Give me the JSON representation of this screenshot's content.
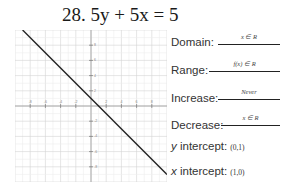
{
  "problem": {
    "number": "28.",
    "equation": "5y + 5x = 5",
    "title": "28. 5y + 5x = 5"
  },
  "graph": {
    "x_ticks": [
      "-8",
      "-6",
      "-4",
      "-2",
      "2",
      "4",
      "6",
      "8"
    ],
    "y_ticks": [
      "8",
      "6",
      "4",
      "2",
      "-2",
      "-4",
      "-6",
      "-8"
    ],
    "line_color": "#222222",
    "grid_color": "#d9d9d9"
  },
  "properties": {
    "domain": {
      "label": "Domain:",
      "value": "x ∈ R"
    },
    "range": {
      "label": "Range:",
      "value": "f(x) ∈ R"
    },
    "increase": {
      "label": "Increase:",
      "value": "Never"
    },
    "decrease": {
      "label": "Decrease:",
      "value": "x ∈ R"
    },
    "y_intercept": {
      "label_var": "y",
      "label_rest": " intercept:",
      "value": "(0,1)"
    },
    "x_intercept": {
      "label_var": "x",
      "label_rest": " intercept:",
      "value": "(1,0)"
    }
  },
  "chart_data": {
    "type": "line",
    "title": "28. 5y + 5x = 5",
    "xlabel": "",
    "ylabel": "",
    "xlim": [
      -10,
      10
    ],
    "ylim": [
      -10,
      10
    ],
    "grid": true,
    "series": [
      {
        "name": "y = -x + 1",
        "x": [
          -9,
          10
        ],
        "y": [
          10,
          -9
        ]
      }
    ],
    "x_tick_labels": [
      "-8",
      "-6",
      "-4",
      "-2",
      "2",
      "4",
      "6",
      "8"
    ],
    "y_tick_labels": [
      "8",
      "6",
      "4",
      "2",
      "-2",
      "-4",
      "-6",
      "-8"
    ],
    "annotations": {
      "y_intercept": "(0,1)",
      "x_intercept": "(1,0)"
    }
  }
}
